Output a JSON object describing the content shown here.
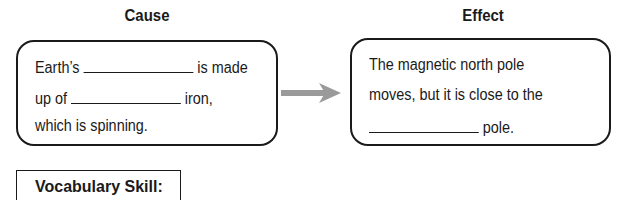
{
  "cause": {
    "heading": "Cause",
    "lines": [
      {
        "before": "Earth’s ",
        "after": " is made"
      },
      {
        "before": "up of ",
        "after": " iron,"
      },
      {
        "text": "which is spinning."
      }
    ]
  },
  "effect": {
    "heading": "Effect",
    "lines": [
      {
        "text": "The magnetic north pole"
      },
      {
        "text": "moves, but it is close to the"
      },
      {
        "before": "",
        "after": " pole."
      }
    ]
  },
  "arrow": {
    "icon": "right-arrow-icon",
    "color": "#999999"
  },
  "vocabulary": {
    "label": "Vocabulary Skill:"
  }
}
